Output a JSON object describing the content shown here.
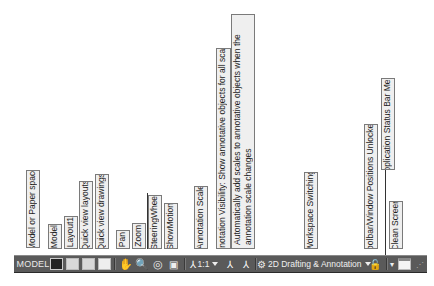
{
  "callouts": [
    {
      "id": "model-paper",
      "text": "Model or Paper space"
    },
    {
      "id": "model",
      "text": "Model"
    },
    {
      "id": "layout1",
      "text": "Layout1"
    },
    {
      "id": "quick-layouts",
      "text": "Quick view layouts"
    },
    {
      "id": "quick-drawings",
      "text": "Quick view drawings"
    },
    {
      "id": "pan",
      "text": "Pan"
    },
    {
      "id": "zoom",
      "text": "Zoom"
    },
    {
      "id": "steeringwheel",
      "text": "SteeringWheel"
    },
    {
      "id": "showmotion",
      "text": "ShowMotion"
    },
    {
      "id": "annotation-scale",
      "text": "Annotation Scale"
    },
    {
      "id": "annotation-visibility",
      "text": "Annotation Visibility: Show annotative objects for all scales"
    },
    {
      "id": "auto-add-scales",
      "text": "Automatically add scales to annotative objects when the annotation scale changes"
    },
    {
      "id": "workspace-switching",
      "text": "Workspace Switching"
    },
    {
      "id": "toolbar-unlocked",
      "text": "Toolbar/Window Positions Unlocked"
    },
    {
      "id": "app-status-menu",
      "text": "Application Status Bar Menu"
    },
    {
      "id": "clean-screen",
      "text": "Clean Screen"
    }
  ],
  "statusbar": {
    "model_label": "MODEL",
    "annotation_scale": "1:1",
    "workspace": "2D Drafting & Annotation"
  }
}
